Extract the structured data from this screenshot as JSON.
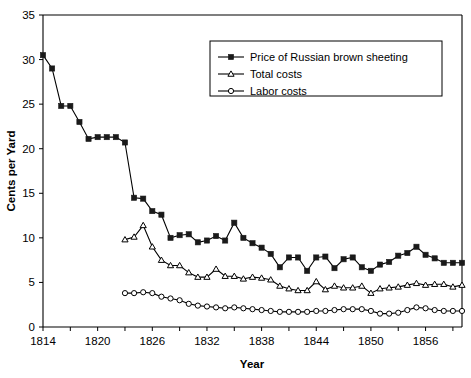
{
  "chart_data": {
    "type": "line",
    "title": "",
    "xlabel": "Year",
    "ylabel": "Cents per Yard",
    "xlim": [
      1814,
      1860
    ],
    "ylim": [
      0,
      35
    ],
    "yticks": [
      0,
      5,
      10,
      15,
      20,
      25,
      30,
      35
    ],
    "xticks": [
      1814,
      1820,
      1826,
      1832,
      1838,
      1844,
      1850,
      1856
    ],
    "xtick_labels": [
      "1814",
      "1820",
      "1826",
      "1832",
      "1838",
      "1844",
      "1850",
      "1856"
    ],
    "ytick_labels": [
      "0",
      "5",
      "10",
      "15",
      "20",
      "25",
      "30",
      "35"
    ],
    "grid": false,
    "legend_position": "top-right",
    "x": [
      1814,
      1815,
      1816,
      1817,
      1818,
      1819,
      1820,
      1821,
      1822,
      1823,
      1824,
      1825,
      1826,
      1827,
      1828,
      1829,
      1830,
      1831,
      1832,
      1833,
      1834,
      1835,
      1836,
      1837,
      1838,
      1839,
      1840,
      1841,
      1842,
      1843,
      1844,
      1845,
      1846,
      1847,
      1848,
      1849,
      1850,
      1851,
      1852,
      1853,
      1854,
      1855,
      1856,
      1857,
      1858,
      1859,
      1860
    ],
    "series": [
      {
        "name": "Price of Russian brown sheeting",
        "marker": "filled-square",
        "values": [
          30.5,
          29.0,
          24.8,
          24.8,
          23.0,
          21.1,
          21.3,
          21.3,
          21.3,
          20.7,
          14.5,
          14.4,
          13.0,
          12.6,
          10.0,
          10.3,
          10.4,
          9.5,
          9.7,
          10.2,
          9.7,
          11.7,
          10.0,
          9.4,
          8.9,
          8.2,
          6.7,
          7.8,
          7.8,
          6.3,
          7.8,
          7.9,
          6.6,
          7.6,
          7.8,
          6.7,
          6.3,
          7.0,
          7.3,
          8.0,
          8.3,
          9.0,
          8.1,
          7.7,
          7.2,
          7.2,
          7.2
        ]
      },
      {
        "name": "Total costs",
        "marker": "open-triangle",
        "values": [
          null,
          null,
          null,
          null,
          null,
          null,
          null,
          null,
          null,
          9.8,
          10.1,
          11.4,
          9.0,
          7.5,
          6.9,
          6.9,
          6.1,
          5.6,
          5.6,
          6.5,
          5.7,
          5.7,
          5.4,
          5.6,
          5.5,
          5.3,
          4.6,
          4.3,
          4.1,
          4.1,
          5.1,
          4.2,
          4.6,
          4.4,
          4.4,
          4.6,
          3.8,
          4.3,
          4.4,
          4.5,
          4.7,
          4.9,
          4.7,
          4.8,
          4.8,
          4.5,
          4.7
        ]
      },
      {
        "name": "Labor costs",
        "marker": "open-circle",
        "values": [
          null,
          null,
          null,
          null,
          null,
          null,
          null,
          null,
          null,
          3.8,
          3.8,
          3.9,
          3.8,
          3.4,
          3.2,
          3.0,
          2.6,
          2.4,
          2.3,
          2.2,
          2.1,
          2.2,
          2.1,
          2.0,
          1.9,
          1.8,
          1.7,
          1.7,
          1.7,
          1.7,
          1.8,
          1.8,
          1.9,
          2.0,
          2.0,
          2.0,
          1.8,
          1.5,
          1.5,
          1.6,
          1.9,
          2.2,
          2.1,
          1.9,
          1.8,
          1.8,
          1.8
        ]
      }
    ]
  },
  "legend": {
    "entries": [
      {
        "label": "Price of Russian brown sheeting",
        "marker": "filled-square"
      },
      {
        "label": "Total costs",
        "marker": "open-triangle"
      },
      {
        "label": "Labor costs",
        "marker": "open-circle"
      }
    ]
  },
  "axes": {
    "x_title": "Year",
    "y_title": "Cents per Yard"
  },
  "colors": {
    "line": "#000000",
    "marker_fill": "#1a1a1a",
    "marker_open": "#ffffff",
    "background": "#ffffff"
  }
}
